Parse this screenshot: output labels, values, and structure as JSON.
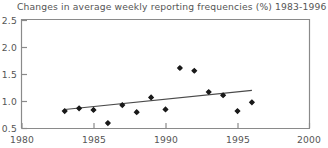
{
  "chart_data": {
    "type": "scatter",
    "title": "Changes in average weekly reporting frequencies (%) 1983-1996",
    "xlabel": "",
    "ylabel": "",
    "xlim": [
      1980,
      2000
    ],
    "ylim": [
      0.5,
      2.5
    ],
    "xticks": [
      1980,
      1985,
      1990,
      1995,
      2000
    ],
    "xtick_labels": [
      "1980",
      "1985",
      "1990",
      "1995",
      "2000"
    ],
    "yticks": [
      0.5,
      1.0,
      1.5,
      2.0,
      2.5
    ],
    "ytick_labels": [
      "0.5",
      "1.0",
      "1.5",
      "2.0",
      "2.5"
    ],
    "grid": false,
    "legend": false,
    "marker": "diamond",
    "marker_color": "#1a1a1a",
    "axis_color": "#8a8a8a",
    "trend_color": "#4a4a4a",
    "x": [
      1983,
      1984,
      1985,
      1986,
      1987,
      1988,
      1989,
      1990,
      1991,
      1992,
      1993,
      1994,
      1995,
      1996
    ],
    "values": [
      0.82,
      0.87,
      0.84,
      0.6,
      0.93,
      0.8,
      1.07,
      0.85,
      1.61,
      1.56,
      1.17,
      1.11,
      0.82,
      0.98
    ],
    "series": [
      {
        "name": "Average weekly reporting frequency change",
        "x": [
          1983,
          1984,
          1985,
          1986,
          1987,
          1988,
          1989,
          1990,
          1991,
          1992,
          1993,
          1994,
          1995,
          1996
        ],
        "values": [
          0.82,
          0.87,
          0.84,
          0.6,
          0.93,
          0.8,
          1.07,
          0.85,
          1.61,
          1.56,
          1.17,
          1.11,
          0.82,
          0.98
        ]
      }
    ],
    "trendline": {
      "type": "linear",
      "x": [
        1983,
        1996
      ],
      "y": [
        0.85,
        1.2
      ]
    }
  }
}
